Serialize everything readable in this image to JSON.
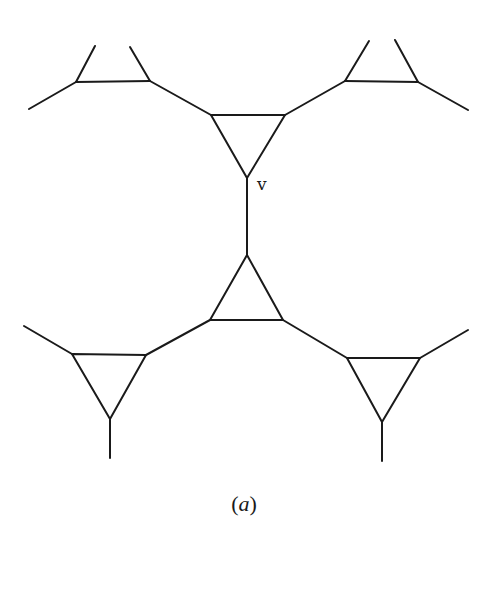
{
  "figure": {
    "caption_open": "(",
    "caption_letter": "a",
    "caption_close": ")",
    "vertex_label": "v",
    "stroke_color": "#1a1a1a",
    "background": "#ffffff"
  },
  "triangles": [
    {
      "name": "top-left-partial",
      "points": [
        [
          76,
          82
        ],
        [
          150,
          81
        ]
      ],
      "partial": true
    },
    {
      "name": "top-right-partial",
      "points": [
        [
          345,
          81
        ],
        [
          418,
          82
        ]
      ],
      "partial": true
    },
    {
      "name": "top-center",
      "points": [
        [
          211,
          115
        ],
        [
          285,
          115
        ],
        [
          247,
          178
        ]
      ]
    },
    {
      "name": "bottom-center",
      "points": [
        [
          247,
          255
        ],
        [
          210,
          320
        ],
        [
          283,
          320
        ]
      ]
    },
    {
      "name": "bottom-left",
      "points": [
        [
          72,
          354
        ],
        [
          146,
          355
        ],
        [
          110,
          419
        ]
      ]
    },
    {
      "name": "bottom-right",
      "points": [
        [
          347,
          358
        ],
        [
          420,
          358
        ],
        [
          382,
          422
        ]
      ]
    }
  ],
  "edges": [
    {
      "name": "top-left-stub-left",
      "from": [
        76,
        82
      ],
      "to": [
        29,
        109
      ]
    },
    {
      "name": "top-left-stub-up-left",
      "from": [
        76,
        82
      ],
      "to": [
        95,
        46
      ]
    },
    {
      "name": "top-left-stub-up-right",
      "from": [
        150,
        81
      ],
      "to": [
        130,
        47
      ]
    },
    {
      "name": "top-left-to-top-center",
      "from": [
        150,
        81
      ],
      "to": [
        211,
        115
      ]
    },
    {
      "name": "top-right-stub-up-left",
      "from": [
        345,
        81
      ],
      "to": [
        369,
        41
      ]
    },
    {
      "name": "top-right-stub-up-right",
      "from": [
        418,
        82
      ],
      "to": [
        395,
        40
      ]
    },
    {
      "name": "top-right-stub-right",
      "from": [
        418,
        82
      ],
      "to": [
        468,
        110
      ]
    },
    {
      "name": "top-center-to-top-right",
      "from": [
        285,
        115
      ],
      "to": [
        345,
        81
      ]
    },
    {
      "name": "central-vertical-edge",
      "from": [
        247,
        178
      ],
      "to": [
        247,
        255
      ]
    },
    {
      "name": "bottom-center-to-bottom-left",
      "from": [
        210,
        320
      ],
      "to": [
        146,
        355
      ]
    },
    {
      "name": "bottom-center-to-bottom-right",
      "from": [
        283,
        320
      ],
      "to": [
        347,
        358
      ]
    },
    {
      "name": "bottom-left-stub-left",
      "from": [
        72,
        354
      ],
      "to": [
        24,
        326
      ]
    },
    {
      "name": "bottom-left-stem",
      "from": [
        110,
        419
      ],
      "to": [
        110,
        458
      ]
    },
    {
      "name": "bottom-right-stub-right",
      "from": [
        420,
        358
      ],
      "to": [
        468,
        330
      ]
    },
    {
      "name": "bottom-right-stem",
      "from": [
        382,
        422
      ],
      "to": [
        382,
        461
      ]
    }
  ],
  "labels": {
    "v_position": [
      257,
      190
    ],
    "caption_position": [
      244,
      511
    ]
  }
}
